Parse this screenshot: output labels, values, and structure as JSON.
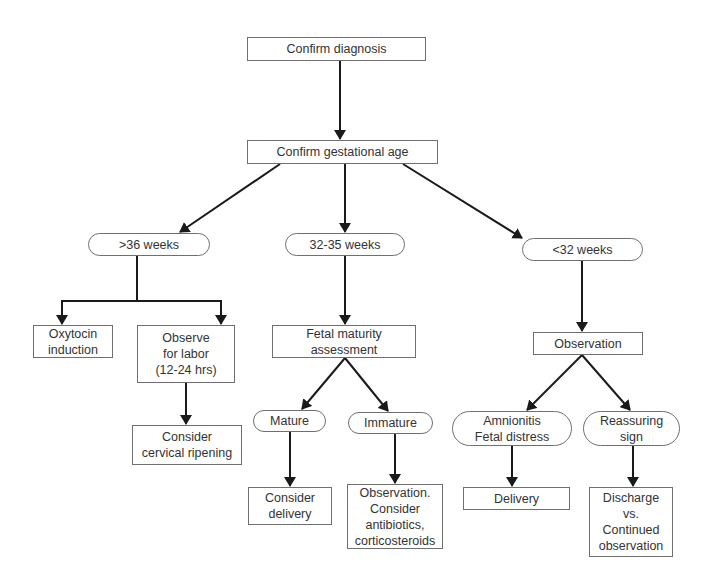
{
  "diagram": {
    "nodes": {
      "confirm_diagnosis": "Confirm diagnosis",
      "confirm_gestational_age": "Confirm gestational age",
      "gt36": ">36 weeks",
      "w32_35": "32-35 weeks",
      "lt32": "<32 weeks",
      "oxytocin": "Oxytocin\ninduction",
      "observe_labor": "Observe\nfor labor\n(12-24 hrs)",
      "cervical_ripening": "Consider\ncervical ripening",
      "fetal_maturity": "Fetal maturity\nassessment",
      "mature": "Mature",
      "immature": "Immature",
      "consider_delivery": "Consider\ndelivery",
      "observation_antibiotics": "Observation.\nConsider\nantibiotics,\ncorticosteroids",
      "observation": "Observation",
      "amnionitis": "Amnionitis\nFetal distress",
      "reassuring": "Reassuring\nsign",
      "delivery": "Delivery",
      "discharge": "Discharge\nvs.\nContinued\nobservation"
    },
    "colors": {
      "line": "#1a1a1a",
      "border": "#6f6f6f",
      "text": "#333333",
      "background": "#ffffff"
    }
  }
}
